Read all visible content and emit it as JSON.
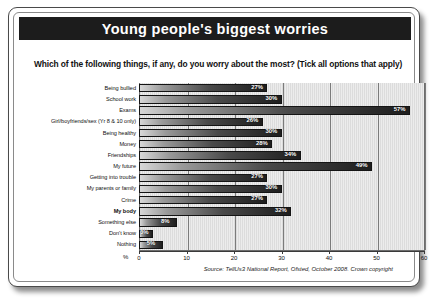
{
  "card": {
    "title": "Young people's biggest worries",
    "subtitle": "Which of the following things, if any, do you worry about the most? (Tick all options that apply)",
    "source": "Source: TellUs3 National Report, Ofsted, October 2008. Crown copyright"
  },
  "chart_data": {
    "type": "bar",
    "orientation": "horizontal",
    "title": "Young people's biggest worries",
    "subtitle": "Which of the following things, if any, do you worry about the most? (Tick all options that apply)",
    "xlabel": "%",
    "ylabel": "",
    "xlim": [
      0,
      60
    ],
    "xticks": [
      0,
      10,
      20,
      30,
      40,
      50,
      60
    ],
    "grid": true,
    "legend": false,
    "value_suffix": "%",
    "categories": [
      "Being bullied",
      "School work",
      "Exams",
      "Girl/boyfriends/sex (Yr 8 & 10 only)",
      "Being healthy",
      "Money",
      "Friendships",
      "My future",
      "Getting into trouble",
      "My parents or family",
      "Crime",
      "My body",
      "Something else",
      "Don't know",
      "Nothing"
    ],
    "values": [
      27,
      30,
      57,
      26,
      30,
      28,
      34,
      49,
      27,
      30,
      27,
      32,
      8,
      3,
      5
    ],
    "value_labels": [
      "27%",
      "30%",
      "57%",
      "26%",
      "30%",
      "28%",
      "34%",
      "49%",
      "27%",
      "30%",
      "27%",
      "32%",
      "8%",
      "3%",
      "5%"
    ],
    "highlighted_category": "My body"
  },
  "colors": {
    "title_bar_bg": "#1c1c1c",
    "title_text": "#ffffff",
    "plot_bg": "#e3e3e3",
    "bar_dark": "#1e1e1e",
    "bar_light": "#d8d8d8",
    "grid": "#7b7b7b",
    "text": "#111111"
  }
}
